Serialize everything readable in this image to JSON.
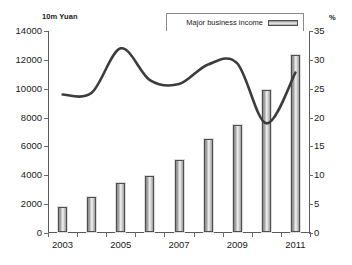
{
  "chart_data": {
    "type": "bar",
    "title": "",
    "xlabel": "",
    "ylabel": "10m Yuan",
    "y2label": "%",
    "categories": [
      "2003",
      "2004",
      "2005",
      "2006",
      "2007",
      "2008",
      "2009",
      "2010",
      "2011"
    ],
    "xtick_labels": [
      "2003",
      "2005",
      "2007",
      "2009",
      "2011"
    ],
    "ylim": [
      0,
      14000
    ],
    "y2lim": [
      0,
      35
    ],
    "yticks": [
      0,
      2000,
      4000,
      6000,
      8000,
      10000,
      12000,
      14000
    ],
    "y2ticks": [
      0,
      5,
      10,
      15,
      20,
      25,
      30,
      35
    ],
    "grid": false,
    "legend_position": "top-right",
    "series": [
      {
        "name": "Major business income",
        "type": "bar",
        "axis": "left",
        "unit": "10m Yuan",
        "values": [
          1700,
          2450,
          3400,
          3850,
          5000,
          6450,
          7450,
          9850,
          12300
        ]
      },
      {
        "name": "Increased",
        "type": "line",
        "axis": "right",
        "unit": "%",
        "values": [
          24.0,
          24.3,
          32.0,
          26.5,
          25.8,
          29.2,
          29.4,
          19.0,
          27.8
        ]
      }
    ]
  },
  "legend": {
    "items": [
      {
        "label": "Major business income",
        "marker": "bar-swatch"
      },
      {
        "label": "Increased",
        "marker": "line-swatch"
      }
    ]
  },
  "axes": {
    "left_unit": "10m Yuan",
    "right_unit": "%"
  },
  "colors": {
    "axis": "#5a5a5a",
    "line": "#3c3c3c",
    "bar_border": "#4f4f4f",
    "background": "#ffffff",
    "text": "#1a1a1a"
  }
}
